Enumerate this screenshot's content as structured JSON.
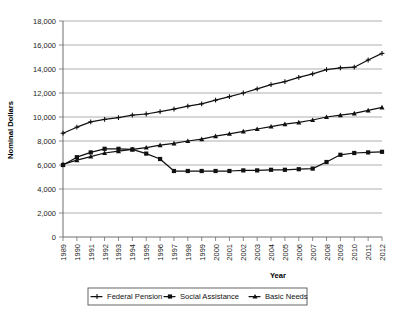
{
  "chart_data": {
    "type": "line",
    "title": "",
    "xlabel": "Year",
    "ylabel": "Nominal Dollars",
    "ylim": [
      0,
      18000
    ],
    "ytick_step": 2000,
    "yticks": [
      "0",
      "2,000",
      "4,000",
      "6,000",
      "8,000",
      "10,000",
      "12,000",
      "14,000",
      "16,000",
      "18,000"
    ],
    "grid": true,
    "legend_position": "bottom",
    "categories": [
      "1989",
      "1990",
      "1991",
      "1992",
      "1993",
      "1994",
      "1995",
      "1996",
      "1997",
      "1998",
      "1999",
      "2000",
      "2001",
      "2002",
      "2003",
      "2004",
      "2005",
      "2006",
      "2007",
      "2008",
      "2009",
      "2010",
      "2011",
      "2012"
    ],
    "series": [
      {
        "name": "Federal Pension",
        "marker": "plus",
        "values": [
          8650,
          9150,
          9600,
          9800,
          9950,
          10150,
          10250,
          10450,
          10650,
          10900,
          11100,
          11400,
          11700,
          12000,
          12350,
          12700,
          12950,
          13300,
          13600,
          13950,
          14100,
          14150,
          14750,
          15300
        ]
      },
      {
        "name": "Social Assistance",
        "marker": "square",
        "values": [
          6000,
          6650,
          7050,
          7350,
          7350,
          7300,
          6950,
          6500,
          5500,
          5500,
          5500,
          5500,
          5500,
          5550,
          5550,
          5600,
          5600,
          5650,
          5700,
          6250,
          6850,
          7000,
          7050,
          7100
        ]
      },
      {
        "name": "Basic Needs",
        "marker": "triangle",
        "values": [
          6050,
          6400,
          6700,
          7000,
          7150,
          7300,
          7450,
          7650,
          7800,
          8000,
          8150,
          8400,
          8600,
          8800,
          9000,
          9200,
          9400,
          9550,
          9750,
          10000,
          10150,
          10300,
          10550,
          10800
        ]
      }
    ]
  },
  "axis": {
    "y_title": "Nominal Dollars",
    "x_title": "Year"
  },
  "legend": {
    "items": [
      {
        "label": "Federal Pension",
        "marker": "plus-marker-icon"
      },
      {
        "label": "Social Assistance",
        "marker": "square-marker-icon"
      },
      {
        "label": "Basic Needs",
        "marker": "triangle-marker-icon"
      }
    ]
  }
}
